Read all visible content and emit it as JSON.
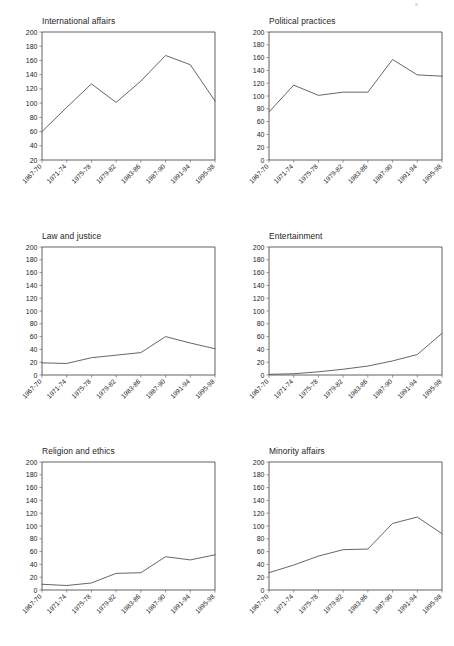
{
  "figure": {
    "background": "#ffffff",
    "line_color": "#4a4a4a",
    "axis_color": "#3a3a3a",
    "text_color": "#1d1d1d",
    "columns": 2,
    "rows": 3
  },
  "chart_data": [
    {
      "type": "line",
      "title": "International affairs",
      "xlabel": "",
      "ylabel": "",
      "categories": [
        "1967-70",
        "1971-74",
        "1975-78",
        "1979-82",
        "1983-86",
        "1987-90",
        "1991-94",
        "1995-98"
      ],
      "values": [
        60,
        94,
        127,
        101,
        131,
        167,
        154,
        103
      ],
      "ylim": [
        0,
        200
      ],
      "yticks": [
        20,
        40,
        60,
        80,
        100,
        120,
        140,
        160,
        180,
        200
      ],
      "ytick_labels": [
        "20",
        "40",
        "60",
        "80",
        "100",
        "120",
        "140",
        "160",
        "180",
        "200"
      ],
      "grid": false,
      "legend": "none"
    },
    {
      "type": "line",
      "title": "Political practices",
      "xlabel": "",
      "ylabel": "",
      "categories": [
        "1967-70",
        "1971-74",
        "1975-78",
        "1979-82",
        "1983-86",
        "1987-90",
        "1991-94",
        "1995-98"
      ],
      "values": [
        75,
        117,
        101,
        106,
        106,
        157,
        133,
        131
      ],
      "ylim": [
        0,
        200
      ],
      "yticks": [
        0,
        20,
        40,
        60,
        80,
        100,
        120,
        140,
        160,
        180,
        200
      ],
      "ytick_labels": [
        "0",
        "20",
        "40",
        "60",
        "80",
        "100",
        "120",
        "140",
        "160",
        "180",
        "200"
      ],
      "grid": false,
      "legend": "none"
    },
    {
      "type": "line",
      "title": "Law and justice",
      "xlabel": "",
      "ylabel": "",
      "categories": [
        "1967-70",
        "1971-74",
        "1975-78",
        "1979-82",
        "1983-86",
        "1987-90",
        "1991-94",
        "1995-98"
      ],
      "values": [
        19,
        18,
        27,
        31,
        35,
        60,
        50,
        41
      ],
      "ylim": [
        0,
        200
      ],
      "yticks": [
        0,
        20,
        40,
        60,
        80,
        100,
        120,
        140,
        160,
        180,
        200
      ],
      "ytick_labels": [
        "0",
        "20",
        "40",
        "60",
        "80",
        "100",
        "120",
        "140",
        "160",
        "180",
        "200"
      ],
      "grid": false,
      "legend": "none"
    },
    {
      "type": "line",
      "title": "Entertainment",
      "xlabel": "",
      "ylabel": "",
      "categories": [
        "1967-70",
        "1971-74",
        "1975-78",
        "1979-82",
        "1983-86",
        "1987-90",
        "1991-94",
        "1995-98"
      ],
      "values": [
        1,
        2,
        5,
        9,
        14,
        22,
        32,
        65
      ],
      "ylim": [
        0,
        200
      ],
      "yticks": [
        0,
        20,
        40,
        60,
        80,
        100,
        120,
        140,
        160,
        180,
        200
      ],
      "ytick_labels": [
        "0",
        "20",
        "40",
        "60",
        "80",
        "100",
        "120",
        "140",
        "160",
        "180",
        "200"
      ],
      "grid": false,
      "legend": "none"
    },
    {
      "type": "line",
      "title": "Religion and ethics",
      "xlabel": "",
      "ylabel": "",
      "categories": [
        "1967-70",
        "1971-74",
        "1975-78",
        "1979-82",
        "1983-86",
        "1987-90",
        "1991-94",
        "1995-98"
      ],
      "values": [
        9,
        7,
        11,
        26,
        27,
        52,
        47,
        55
      ],
      "ylim": [
        0,
        200
      ],
      "yticks": [
        0,
        20,
        40,
        60,
        80,
        100,
        120,
        140,
        160,
        180,
        200
      ],
      "ytick_labels": [
        "0",
        "20",
        "40",
        "60",
        "80",
        "100",
        "120",
        "140",
        "160",
        "180",
        "200"
      ],
      "grid": false,
      "legend": "none"
    },
    {
      "type": "line",
      "title": "Minority affairs",
      "xlabel": "",
      "ylabel": "",
      "categories": [
        "1967-70",
        "1971-74",
        "1975-78",
        "1979-82",
        "1983-86",
        "1987-90",
        "1991-94",
        "1995-98"
      ],
      "values": [
        27,
        39,
        53,
        63,
        64,
        104,
        114,
        88
      ],
      "ylim": [
        0,
        200
      ],
      "yticks": [
        0,
        20,
        40,
        60,
        80,
        100,
        120,
        140,
        160,
        180,
        200
      ],
      "ytick_labels": [
        "0",
        "20",
        "40",
        "60",
        "80",
        "100",
        "120",
        "140",
        "160",
        "180",
        "200"
      ],
      "grid": false,
      "legend": "none"
    }
  ]
}
